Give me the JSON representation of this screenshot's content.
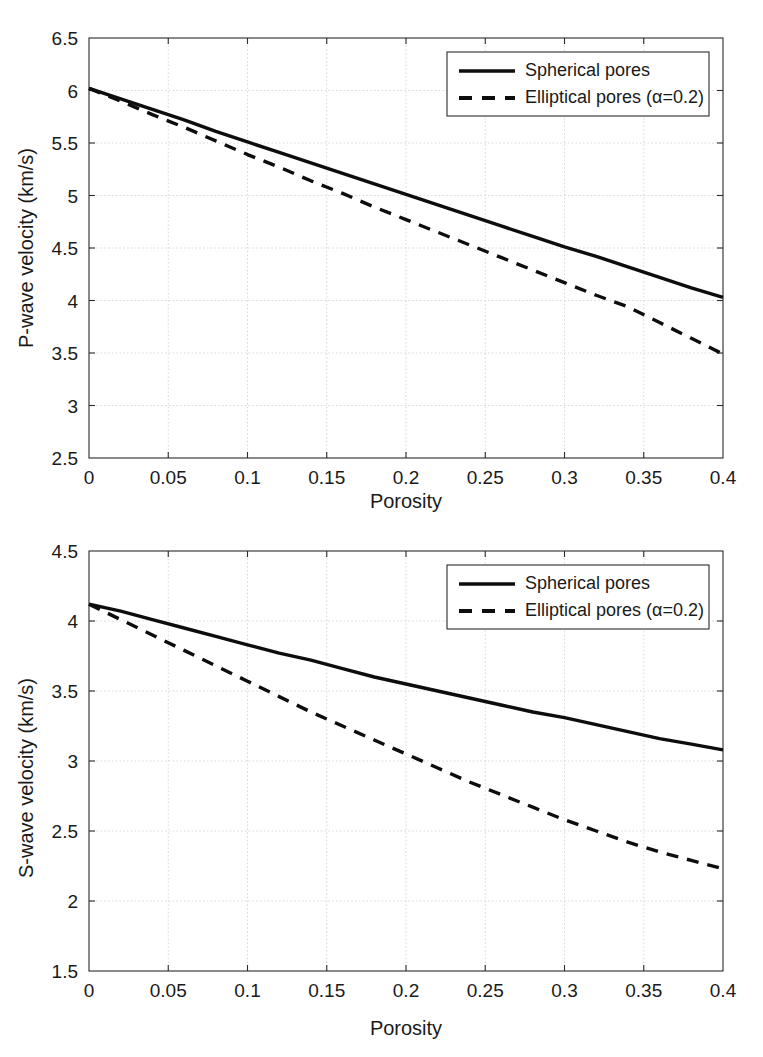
{
  "figure": {
    "background": "#ffffff",
    "line_color": "#0d0d0d",
    "grid_color": "#cfcfcf",
    "axis_color": "#2a2a2a"
  },
  "chart_data": [
    {
      "type": "line",
      "panel": "top",
      "title": "",
      "xlabel": "Porosity",
      "ylabel": "P-wave velocity (km/s)",
      "xlim": [
        0,
        0.4
      ],
      "ylim": [
        2.5,
        6.5
      ],
      "xticks": [
        0,
        0.05,
        0.1,
        0.15,
        0.2,
        0.25,
        0.3,
        0.35,
        0.4
      ],
      "xticklabels": [
        "0",
        "0.05",
        "0.1",
        "0.15",
        "0.2",
        "0.25",
        "0.3",
        "0.35",
        "0.4"
      ],
      "yticks": [
        2.5,
        3,
        3.5,
        4,
        4.5,
        5,
        5.5,
        6,
        6.5
      ],
      "yticklabels": [
        "2.5",
        "3",
        "3.5",
        "4",
        "4.5",
        "5",
        "5.5",
        "6",
        "6.5"
      ],
      "grid": true,
      "legend_position": "upper right",
      "x": [
        0,
        0.02,
        0.04,
        0.06,
        0.08,
        0.1,
        0.12,
        0.14,
        0.16,
        0.18,
        0.2,
        0.22,
        0.24,
        0.26,
        0.28,
        0.3,
        0.32,
        0.34,
        0.36,
        0.38,
        0.4
      ],
      "series": [
        {
          "name": "Spherical pores",
          "style": "solid",
          "values": [
            6.02,
            5.92,
            5.82,
            5.72,
            5.61,
            5.51,
            5.41,
            5.31,
            5.21,
            5.11,
            5.01,
            4.91,
            4.81,
            4.71,
            4.61,
            4.51,
            4.42,
            4.32,
            4.22,
            4.12,
            4.03
          ]
        },
        {
          "name": "Elliptical pores (α=0.2)",
          "style": "dashed",
          "values": [
            6.02,
            5.9,
            5.77,
            5.65,
            5.52,
            5.39,
            5.27,
            5.14,
            5.02,
            4.89,
            4.77,
            4.65,
            4.53,
            4.41,
            4.29,
            4.17,
            4.05,
            3.94,
            3.79,
            3.64,
            3.49
          ]
        }
      ]
    },
    {
      "type": "line",
      "panel": "bottom",
      "title": "",
      "xlabel": "Porosity",
      "ylabel": "S-wave velocity (km/s)",
      "xlim": [
        0,
        0.4
      ],
      "ylim": [
        1.5,
        4.5
      ],
      "xticks": [
        0,
        0.05,
        0.1,
        0.15,
        0.2,
        0.25,
        0.3,
        0.35,
        0.4
      ],
      "xticklabels": [
        "0",
        "0.05",
        "0.1",
        "0.15",
        "0.2",
        "0.25",
        "0.3",
        "0.35",
        "0.4"
      ],
      "yticks": [
        1.5,
        2,
        2.5,
        3,
        3.5,
        4,
        4.5
      ],
      "yticklabels": [
        "1.5",
        "2",
        "2.5",
        "3",
        "3.5",
        "4",
        "4.5"
      ],
      "grid": true,
      "legend_position": "upper right",
      "x": [
        0,
        0.02,
        0.04,
        0.06,
        0.08,
        0.1,
        0.12,
        0.14,
        0.16,
        0.18,
        0.2,
        0.22,
        0.24,
        0.26,
        0.28,
        0.3,
        0.32,
        0.34,
        0.36,
        0.38,
        0.4
      ],
      "series": [
        {
          "name": "Spherical pores",
          "style": "solid",
          "values": [
            4.12,
            4.07,
            4.01,
            3.95,
            3.89,
            3.83,
            3.77,
            3.72,
            3.66,
            3.6,
            3.55,
            3.5,
            3.45,
            3.4,
            3.35,
            3.31,
            3.26,
            3.21,
            3.16,
            3.12,
            3.08
          ]
        },
        {
          "name": "Elliptical pores (α=0.2)",
          "style": "dashed",
          "values": [
            4.12,
            4.01,
            3.9,
            3.79,
            3.68,
            3.57,
            3.46,
            3.35,
            3.25,
            3.15,
            3.05,
            2.95,
            2.85,
            2.76,
            2.67,
            2.58,
            2.5,
            2.42,
            2.35,
            2.29,
            2.23
          ]
        }
      ]
    }
  ],
  "legend": {
    "entries": [
      {
        "label": "Spherical pores",
        "style": "solid"
      },
      {
        "label": "Elliptical pores (α=0.2)",
        "style": "dashed"
      }
    ]
  }
}
